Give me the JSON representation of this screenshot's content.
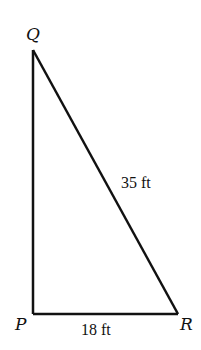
{
  "diagram": {
    "type": "right-triangle",
    "vertices": {
      "Q": {
        "label": "Q",
        "x": 33,
        "y": 50
      },
      "P": {
        "label": "P",
        "x": 33,
        "y": 314
      },
      "R": {
        "label": "R",
        "x": 178,
        "y": 314
      }
    },
    "measurements": {
      "hypotenuse_QR": "35 ft",
      "base_PR": "18 ft"
    },
    "stroke_color": "#111111",
    "background": "#ffffff"
  }
}
